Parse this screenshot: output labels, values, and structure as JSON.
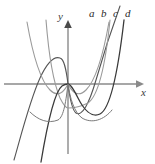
{
  "figure": {
    "kind": "math-graph",
    "background": "#ffffff",
    "width": 155,
    "height": 164,
    "axes": {
      "x_label": "x",
      "y_label": "y",
      "axis_color": "#8a8a8a",
      "origin": {
        "x": 68,
        "y": 84
      },
      "x_axis_from": {
        "x": 4,
        "y": 84
      },
      "x_axis_to": {
        "x": 140,
        "y": 84
      },
      "y_axis_from": {
        "x": 68,
        "y": 152
      },
      "y_axis_to": {
        "x": 68,
        "y": 22
      },
      "arrows": [
        "x-right",
        "y-up"
      ]
    },
    "labels": [
      {
        "id": "a",
        "text": "a",
        "x": 89,
        "y": 8,
        "color": "#2b2b2b"
      },
      {
        "id": "b",
        "text": "b",
        "x": 101,
        "y": 8,
        "color": "#2b2b2b"
      },
      {
        "id": "c",
        "text": "c",
        "x": 113,
        "y": 8,
        "color": "#2b2b2b"
      },
      {
        "id": "d",
        "text": "d",
        "x": 125,
        "y": 8,
        "color": "#2b2b2b"
      }
    ]
  },
  "chart_data": {
    "type": "line",
    "title": "",
    "subtitle": "",
    "xlabel": "x",
    "ylabel": "y",
    "xlim": [
      -2.2,
      2.2
    ],
    "ylim": [
      -2.2,
      2.2
    ],
    "grid": false,
    "legend_position": "top-right-inline",
    "annotations": [
      "a",
      "b",
      "c",
      "d"
    ],
    "note": "Four power-type curves y = x^n through the origin; two odd (S-shaped, dark) and two even (U-shaped, light gray).",
    "series": [
      {
        "name": "a",
        "label": "a",
        "color": "#555555",
        "width": 1.1,
        "kind": "odd",
        "path": "M 14,160 C 22,132 30,100 40,78 C 47,63 54,56 60,58 C 64,59 66,68 68,84 C 70,100 72,110 76,113 C 82,117 89,104 96,80 C 104,52 112,28 120,6"
      },
      {
        "name": "b",
        "label": "b",
        "color": "#9a9a9a",
        "width": 1.1,
        "kind": "even",
        "path": "M 27,22 C 33,56 40,80 50,90 C 58,98 64,92 68,84 C 72,92 78,98 86,90 C 96,80 103,56 109,22"
      },
      {
        "name": "c",
        "label": "c",
        "color": "#9a9a9a",
        "width": 1.1,
        "kind": "even-flat",
        "path": "M 46,20 C 49,58 54,84 60,98 C 64,106 66,108 68,108 C 74,108 80,107 88,103 C 98,96 105,70 110,20"
      },
      {
        "name": "d",
        "label": "d",
        "color": "#3a3a3a",
        "width": 1.3,
        "kind": "odd-steep",
        "path": "M 41,162 C 47,126 54,92 62,86 C 65,84 67,84 68,84 C 70,84 73,88 78,98 C 84,110 92,118 100,114 C 110,109 118,72 124,20"
      },
      {
        "name": "e",
        "label": "",
        "color": "#7a7a7a",
        "width": 1.0,
        "kind": "even-wide",
        "path": "M 30,112 C 38,120 48,124 58,120 C 64,117 66,100 68,84 C 70,98 74,112 82,118 C 92,124 104,120 112,110"
      }
    ]
  }
}
